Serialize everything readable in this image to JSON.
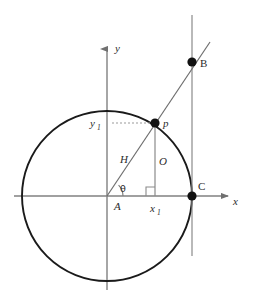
{
  "figure": {
    "background_color": "#ffffff",
    "width": 253,
    "height": 302
  },
  "style": {
    "circle_stroke": "#1a1a1a",
    "axis_stroke": "#808080",
    "ray_stroke": "#6e6e6e",
    "vertical_line_stroke": "#8a8a8a",
    "drop_line_stroke": "#8a8a8a",
    "dotted_stroke": "#9a9a9a",
    "point_fill": "#111111",
    "label_color": "#2b2b2b"
  },
  "geometry": {
    "origin": {
      "x": 107,
      "y": 196
    },
    "circle": {
      "cx": 107,
      "cy": 196,
      "r": 85
    },
    "point_p": {
      "x": 155,
      "y": 123
    },
    "point_b": {
      "x": 192,
      "y": 62
    },
    "point_c": {
      "x": 192,
      "y": 196
    },
    "ray_end": {
      "x": 210,
      "y": 42
    },
    "vertical_line": {
      "x": 192,
      "y_top": 15,
      "y_bottom": 256
    },
    "drop_foot": {
      "x": 155,
      "y": 196
    },
    "dotted_y1": {
      "x_start": 113,
      "x_end": 155,
      "y": 123
    },
    "y_axis": {
      "x": 107,
      "y_top": 45,
      "y_bottom": 290
    },
    "x_axis": {
      "y": 196,
      "x_left": 14,
      "x_right": 232
    },
    "right_angle_marker": {
      "x": 146,
      "y": 187,
      "size": 9
    },
    "theta_arc_radius": 16
  },
  "labels": {
    "axis_y": "y",
    "axis_x": "x",
    "angle_theta": "θ",
    "vertex_a": "A",
    "point_b": "B",
    "point_c": "C",
    "point_p": "p",
    "hypotenuse": "H",
    "opposite": "O",
    "x_coord_base": "x",
    "x_coord_sub": "1",
    "y_coord_base": "y",
    "y_coord_sub": "1"
  },
  "label_positions": {
    "axis_y": {
      "x": 115,
      "y": 52
    },
    "axis_x": {
      "x": 233,
      "y": 205
    },
    "angle_theta": {
      "x": 120,
      "y": 192
    },
    "vertex_a": {
      "x": 114,
      "y": 210
    },
    "point_b": {
      "x": 200,
      "y": 66
    },
    "point_c": {
      "x": 198,
      "y": 190
    },
    "point_p": {
      "x": 163,
      "y": 126
    },
    "hypotenuse": {
      "x": 120,
      "y": 162
    },
    "opposite": {
      "x": 160,
      "y": 164
    },
    "x_coord": {
      "x": 150,
      "y": 211
    },
    "y_coord": {
      "x": 92,
      "y": 127
    }
  }
}
